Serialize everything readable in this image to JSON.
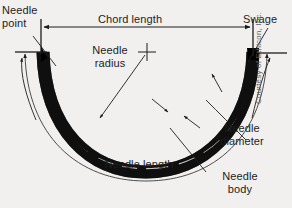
{
  "figure": {
    "background_color": "#f1f0ee",
    "ink_color": "#1d1d1d",
    "needle_color": "#000000",
    "highlight_color": "#ffffff",
    "credit": "Courtesy of Ethicon, Inc."
  },
  "labels": {
    "needle_point": "Needle\npoint",
    "chord_length": "Chord length",
    "swage": "Swage",
    "needle_radius": "Needle\nradius",
    "needle_length": "Needle length",
    "needle_diameter": "Needle\ndiameter",
    "needle_body": "Needle\nbody"
  },
  "annotations": {
    "chord_length_dimension": "double-headed horizontal arrow between needle point and swage",
    "needle_length_dimension": "curved double-headed arc arrow following the needle curvature",
    "needle_radius_marker": "crosshair marking the arc center with leader line to the needle",
    "needle_diameter_markers": "two opposing arrows pointing at the inner and outer edges of the needle body",
    "needle_point_leader": "leader line from the needle point label to the needle tip",
    "swage_leader": "leader line from the swage label to the needle swage end"
  }
}
